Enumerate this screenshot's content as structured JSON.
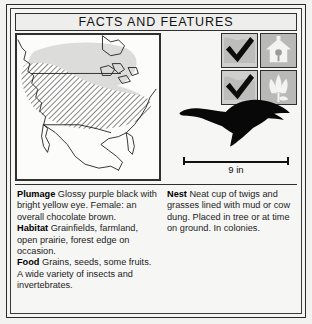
{
  "card": {
    "title": "FACTS AND FEATURES"
  },
  "map": {
    "name": "north-america-range-map",
    "regions": [
      {
        "id": "summer-range",
        "label": "summer range",
        "fill": "#dcdcda",
        "style": "solid-light-gray"
      },
      {
        "id": "year-round-range",
        "label": "year-round range",
        "fill": "#9a9a98",
        "style": "diagonal-hatch"
      }
    ]
  },
  "icons": {
    "cells": [
      {
        "id": "check-1",
        "icon": "checkmark-icon",
        "checked": true
      },
      {
        "id": "habitat-birdhouse",
        "icon": "birdhouse-icon",
        "checked": false
      },
      {
        "id": "check-2",
        "icon": "checkmark-icon",
        "checked": true
      },
      {
        "id": "habitat-flower",
        "icon": "flower-icon",
        "checked": false
      }
    ]
  },
  "illustration": {
    "subject": "flying-bird-silhouette",
    "scale_label": "9 in"
  },
  "facts": {
    "left": [
      {
        "label": "Plumage",
        "text": "Glossy purple black with bright yellow eye. Female: an overall chocolate brown."
      },
      {
        "label": "Habitat",
        "text": "Grainfields, farmland, open prairie, forest edge on occasion."
      },
      {
        "label": "Food",
        "text": "Grains, seeds, some fruits. A wide variety of insects and invertebrates."
      }
    ],
    "right": [
      {
        "label": "Nest",
        "text": "Neat cup of twigs and grasses lined with mud or cow dung. Placed in tree or at time on ground. In colonies."
      }
    ]
  }
}
